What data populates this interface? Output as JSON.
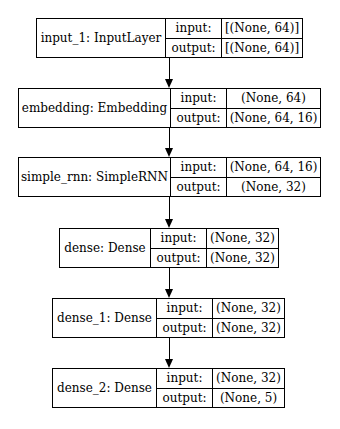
{
  "diagram": {
    "type": "keras-model-plot",
    "nodes": [
      {
        "id": "input_1",
        "name": "input_1: InputLayer",
        "input_label": "input:",
        "input": "[(None, 64)]",
        "output_label": "output:",
        "output": "[(None, 64)]"
      },
      {
        "id": "embedding",
        "name": "embedding: Embedding",
        "input_label": "input:",
        "input": "(None, 64)",
        "output_label": "output:",
        "output": "(None, 64, 16)"
      },
      {
        "id": "simple_rnn",
        "name": "simple_rnn: SimpleRNN",
        "input_label": "input:",
        "input": "(None, 64, 16)",
        "output_label": "output:",
        "output": "(None, 32)"
      },
      {
        "id": "dense",
        "name": "dense: Dense",
        "input_label": "input:",
        "input": "(None, 32)",
        "output_label": "output:",
        "output": "(None, 32)"
      },
      {
        "id": "dense_1",
        "name": "dense_1: Dense",
        "input_label": "input:",
        "input": "(None, 32)",
        "output_label": "output:",
        "output": "(None, 32)"
      },
      {
        "id": "dense_2",
        "name": "dense_2: Dense",
        "input_label": "input:",
        "input": "(None, 32)",
        "output_label": "output:",
        "output": "(None, 5)"
      }
    ],
    "edges": [
      [
        "input_1",
        "embedding"
      ],
      [
        "embedding",
        "simple_rnn"
      ],
      [
        "simple_rnn",
        "dense"
      ],
      [
        "dense",
        "dense_1"
      ],
      [
        "dense_1",
        "dense_2"
      ]
    ]
  }
}
